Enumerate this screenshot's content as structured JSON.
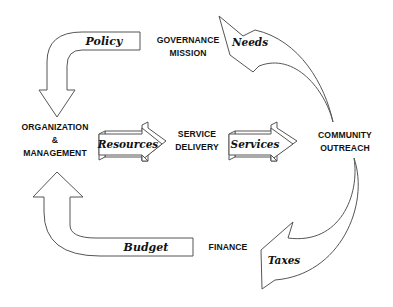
{
  "nodes": {
    "governance": {
      "line1": "GOVERNANCE",
      "line2": "MISSION"
    },
    "organization": {
      "line1": "ORGANIZATION",
      "line2": "&",
      "line3": "MANAGEMENT"
    },
    "service_delivery": {
      "line1": "SERVICE",
      "line2": "DELIVERY"
    },
    "community": {
      "line1": "COMMUNITY",
      "line2": "OUTREACH"
    },
    "finance": {
      "line1": "FINANCE"
    }
  },
  "arrows": {
    "policy": "Policy",
    "needs": "Needs",
    "resources": "Resources",
    "services": "Services",
    "taxes": "Taxes",
    "budget": "Budget"
  },
  "colors": {
    "stroke": "#555555",
    "text": "#111111",
    "background": "#ffffff"
  }
}
